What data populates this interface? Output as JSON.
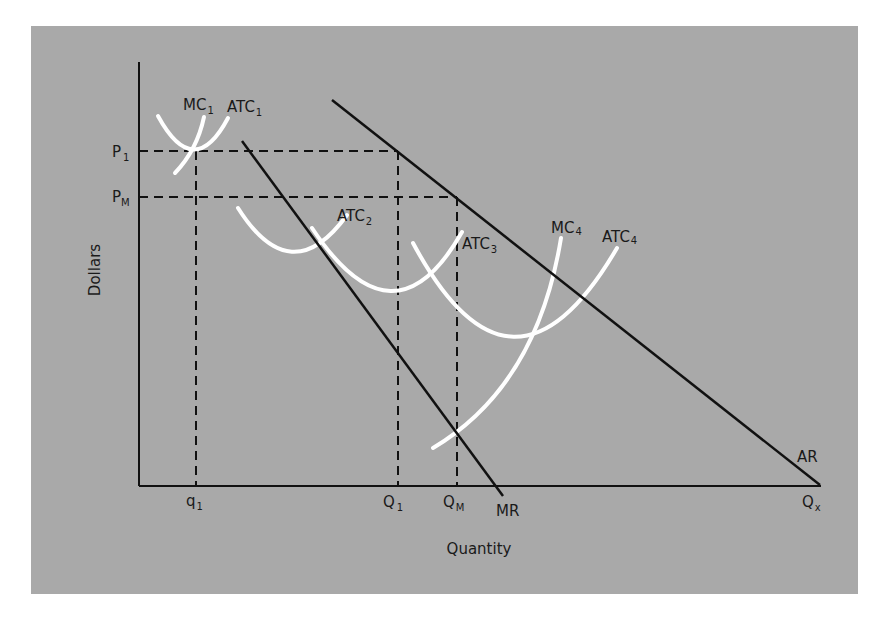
{
  "figure": {
    "panel_color": "#a9a9a9",
    "line_color": "#111111",
    "cost_curve_color": "#ffffff",
    "axes": {
      "y_label": "Dollars",
      "x_label": "Quantity"
    },
    "y_ticks": [
      {
        "main": "P",
        "sub": "1"
      },
      {
        "main": "P",
        "sub": "M"
      }
    ],
    "x_ticks": [
      {
        "main": "q",
        "sub": "1"
      },
      {
        "main": "Q",
        "sub": "1"
      },
      {
        "main": "Q",
        "sub": "M"
      },
      {
        "main": "Q",
        "sub": "x"
      }
    ],
    "curve_labels": {
      "mc1": {
        "main": "MC",
        "sub": "1"
      },
      "atc1": {
        "main": "ATC",
        "sub": "1"
      },
      "atc2": {
        "main": "ATC",
        "sub": "2"
      },
      "atc3": {
        "main": "ATC",
        "sub": "3"
      },
      "mc4": {
        "main": "MC",
        "sub": "4"
      },
      "atc4": {
        "main": "ATC",
        "sub": "4"
      },
      "mr": "MR",
      "ar": "AR"
    }
  }
}
